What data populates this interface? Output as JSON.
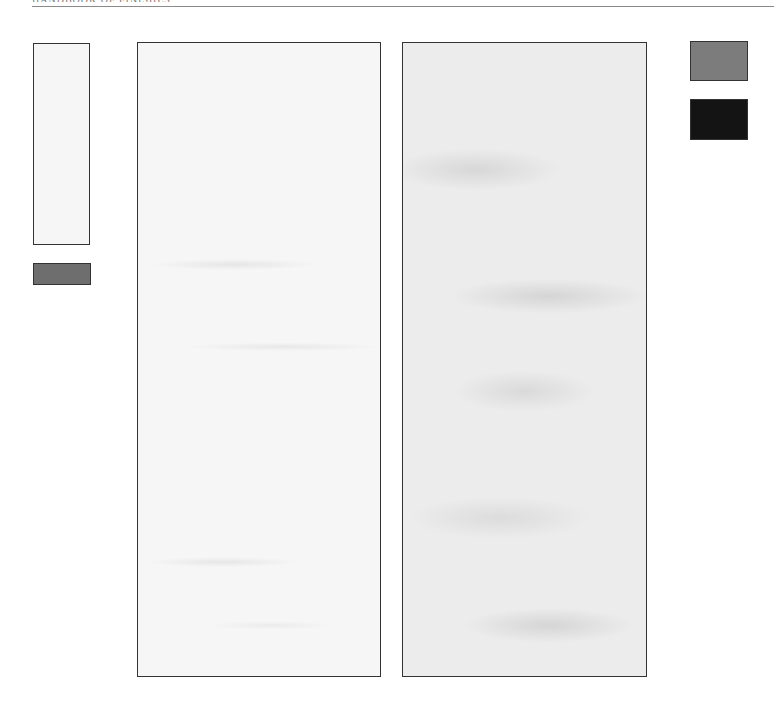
{
  "page": {
    "running_header": "HANDBOOK OF FINISHES",
    "rule_color": "#8a8a8a"
  },
  "swatches": {
    "small_left_tall": {
      "color": "#f6f6f6",
      "label": ""
    },
    "small_left_bar": {
      "color": "#6e6e6e",
      "label": ""
    },
    "panel_light_marble": {
      "color": "#f6f6f6",
      "label": ""
    },
    "panel_grey_marble": {
      "color": "#ececec",
      "label": ""
    },
    "small_right_grey": {
      "color": "#7c7c7c",
      "label": ""
    },
    "small_right_black": {
      "color": "#141414",
      "label": ""
    }
  }
}
